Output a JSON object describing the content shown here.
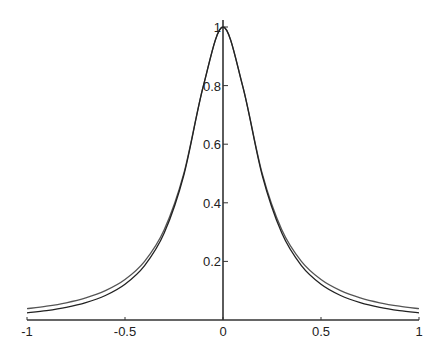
{
  "chart_data": {
    "type": "line",
    "title": "",
    "xlabel": "",
    "ylabel": "",
    "xlim": [
      -1,
      1
    ],
    "ylim": [
      0,
      1
    ],
    "grid": false,
    "legend": null,
    "x_ticks": [
      -1,
      -0.5,
      0,
      0.5,
      1
    ],
    "x_tick_labels": [
      "-1",
      "-0.5",
      "0",
      "0.5",
      "1"
    ],
    "y_ticks": [
      0.2,
      0.4,
      0.6,
      0.8,
      1
    ],
    "y_tick_labels": [
      "0.2",
      "0.4",
      "0.6",
      "0.8",
      "1"
    ],
    "x": [
      -1,
      -0.9,
      -0.8,
      -0.7,
      -0.6,
      -0.5,
      -0.4,
      -0.3,
      -0.2,
      -0.1,
      0,
      0.1,
      0.2,
      0.3,
      0.4,
      0.5,
      0.6,
      0.7,
      0.8,
      0.9,
      1
    ],
    "series": [
      {
        "name": "curve 1 (wider tails)",
        "color": "#555555",
        "values": [
          0.0385,
          0.0471,
          0.0588,
          0.0755,
          0.1,
          0.1379,
          0.2,
          0.3077,
          0.5,
          0.8,
          1,
          0.8,
          0.5,
          0.3077,
          0.2,
          0.1379,
          0.1,
          0.0755,
          0.0588,
          0.0471,
          0.0385
        ]
      },
      {
        "name": "curve 2 (narrower tails)",
        "color": "#222222",
        "values": [
          0.0244,
          0.0322,
          0.0432,
          0.0593,
          0.0837,
          0.1221,
          0.1857,
          0.2966,
          0.4941,
          0.799,
          1,
          0.799,
          0.4941,
          0.2966,
          0.1857,
          0.1221,
          0.0837,
          0.0593,
          0.0432,
          0.0322,
          0.0244
        ]
      }
    ],
    "axes_style": {
      "axis_color": "#333333",
      "spine": "cross-at-origin"
    }
  }
}
